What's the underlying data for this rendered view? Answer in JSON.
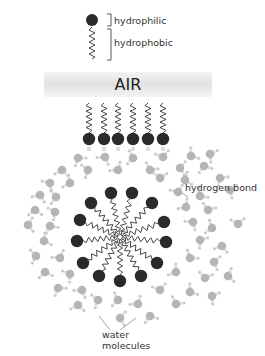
{
  "legend": {
    "hydrophilic_label": "hydrophilic",
    "hydrophobic_label": "hydrophobic"
  },
  "air": {
    "label": "AIR"
  },
  "annotations": {
    "hydrogen_bond": "hydrogen bond",
    "water_molecules_line1": "water",
    "water_molecules_line2": "molecules"
  },
  "colors": {
    "head": "#2a2a2a",
    "tail": "#333333",
    "water": "#b5b5b5",
    "water_h": "#c9c9c9",
    "bond": "#8a8a8a",
    "air_bar": "#e6e6e6",
    "text": "#333333"
  },
  "micelle": {
    "center": [
      120,
      237
    ],
    "heads": [
      [
        111,
        193
      ],
      [
        132,
        193
      ],
      [
        91,
        203
      ],
      [
        152,
        203
      ],
      [
        80,
        220
      ],
      [
        164,
        222
      ],
      [
        77,
        241
      ],
      [
        166,
        242
      ],
      [
        83,
        263
      ],
      [
        157,
        263
      ],
      [
        99,
        276
      ],
      [
        141,
        276
      ],
      [
        120,
        281
      ]
    ]
  },
  "surface_row": {
    "heads_y": 139,
    "tail_top_y": 103,
    "xs": [
      89,
      104,
      118,
      133,
      148,
      163
    ]
  },
  "water_molecules": [
    [
      78,
      158
    ],
    [
      105,
      157
    ],
    [
      133,
      158
    ],
    [
      163,
      157
    ],
    [
      191,
      156
    ],
    [
      210,
      154
    ],
    [
      62,
      170
    ],
    [
      88,
      170
    ],
    [
      118,
      170
    ],
    [
      150,
      170
    ],
    [
      180,
      168
    ],
    [
      204,
      166
    ],
    [
      50,
      183
    ],
    [
      70,
      183
    ],
    [
      160,
      178
    ],
    [
      185,
      180
    ],
    [
      220,
      178
    ],
    [
      40,
      195
    ],
    [
      56,
      197
    ],
    [
      178,
      192
    ],
    [
      200,
      196
    ],
    [
      230,
      190
    ],
    [
      35,
      210
    ],
    [
      55,
      212
    ],
    [
      186,
      207
    ],
    [
      208,
      210
    ],
    [
      28,
      225
    ],
    [
      50,
      226
    ],
    [
      193,
      222
    ],
    [
      212,
      228
    ],
    [
      238,
      224
    ],
    [
      44,
      241
    ],
    [
      200,
      240
    ],
    [
      222,
      246
    ],
    [
      36,
      256
    ],
    [
      60,
      258
    ],
    [
      190,
      258
    ],
    [
      214,
      262
    ],
    [
      45,
      272
    ],
    [
      70,
      274
    ],
    [
      176,
      272
    ],
    [
      205,
      278
    ],
    [
      228,
      276
    ],
    [
      58,
      288
    ],
    [
      82,
      290
    ],
    [
      118,
      300
    ],
    [
      160,
      290
    ],
    [
      190,
      292
    ],
    [
      212,
      296
    ],
    [
      78,
      305
    ],
    [
      98,
      300
    ],
    [
      138,
      304
    ],
    [
      176,
      304
    ],
    [
      120,
      318
    ],
    [
      150,
      316
    ]
  ]
}
